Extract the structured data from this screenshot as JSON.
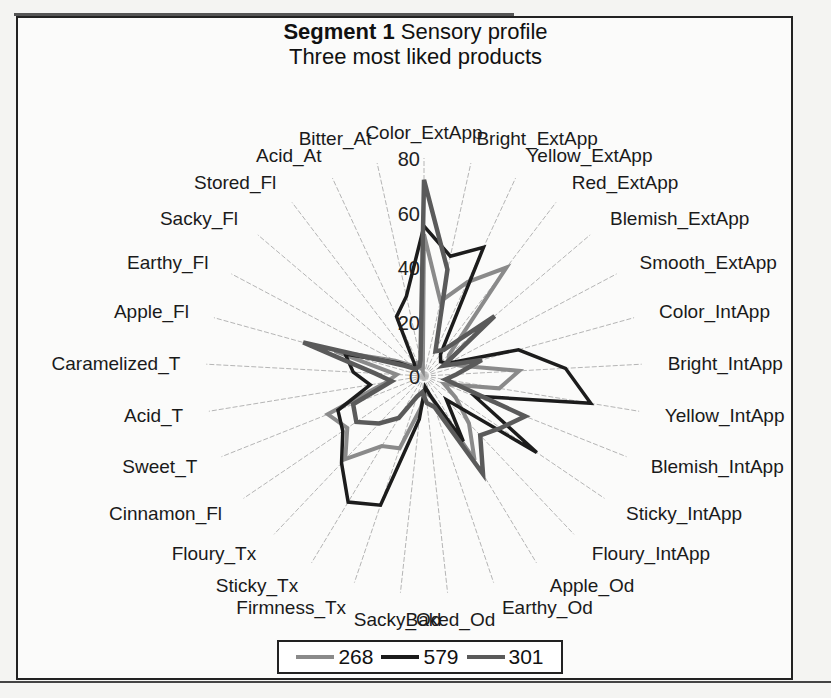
{
  "chart_data": {
    "type": "radar",
    "title": "Segment 1 Sensory profile",
    "title_bold_part": "Segment 1",
    "title_rest": "Sensory profile",
    "subtitle": "Three most liked products",
    "radial_ticks": [
      0,
      20,
      40,
      60,
      80
    ],
    "rlim": [
      0,
      80
    ],
    "grid": "spokes only",
    "legend_position": "bottom",
    "categories": [
      "Color_ExtApp",
      "Bright_ExtApp",
      "Yellow_ExtApp",
      "Red_ExtApp",
      "Blemish_ExtApp",
      "Smooth_ExtApp",
      "Color_IntApp",
      "Bright_IntApp",
      "Yellow_IntApp",
      "Blemish_IntApp",
      "Sticky_IntApp",
      "Floury_IntApp",
      "Apple_Od",
      "Earthy_Od",
      "Baked_Od",
      "Sacky_Od",
      "Firmness_Tx",
      "Sticky_Tx",
      "Floury_Tx",
      "Cinnamon_Fl",
      "Sweet_T",
      "Acid_T",
      "Caramelized_T",
      "Apple_Fl",
      "Earthy_Fl",
      "Sacky_Fl",
      "Stored_Fl",
      "Acid_At",
      "Bitter_At"
    ],
    "series": [
      {
        "name": "268",
        "color": "#8a8a8a",
        "width": 4,
        "values": [
          52,
          28,
          38,
          50,
          12,
          10,
          14,
          35,
          28,
          8,
          14,
          24,
          36,
          8,
          6,
          12,
          28,
          30,
          42,
          34,
          38,
          14,
          10,
          34,
          12,
          6,
          4,
          6,
          2
        ]
      },
      {
        "name": "579",
        "color": "#1c1c1c",
        "width": 3.5,
        "values": [
          55,
          45,
          52,
          10,
          8,
          10,
          36,
          52,
          62,
          20,
          50,
          12,
          28,
          8,
          4,
          16,
          50,
          54,
          44,
          36,
          34,
          20,
          26,
          30,
          10,
          4,
          6,
          24,
          30
        ]
      },
      {
        "name": "301",
        "color": "#5a5a5a",
        "width": 4.5,
        "values": [
          72,
          40,
          10,
          12,
          34,
          8,
          22,
          12,
          8,
          40,
          34,
          30,
          42,
          12,
          10,
          6,
          8,
          18,
          24,
          30,
          28,
          12,
          18,
          46,
          8,
          4,
          4,
          4,
          6
        ]
      }
    ]
  },
  "legend": {
    "items": [
      {
        "label": "268",
        "color": "#8a8a8a"
      },
      {
        "label": "579",
        "color": "#1c1c1c"
      },
      {
        "label": "301",
        "color": "#5a5a5a"
      }
    ]
  }
}
